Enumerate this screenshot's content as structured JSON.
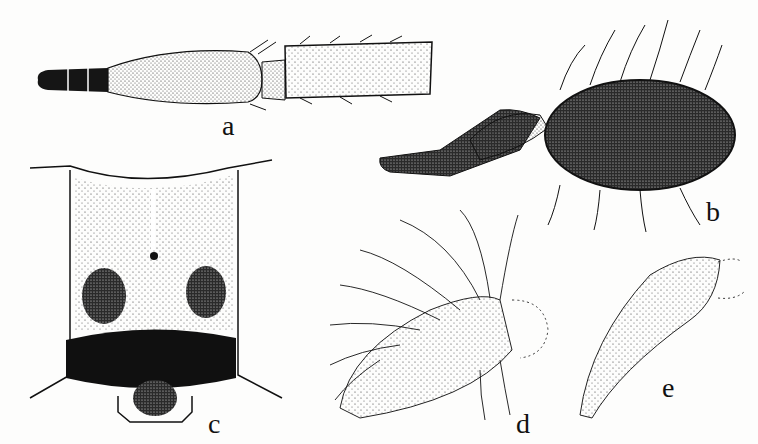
{
  "plate": {
    "description": "Scientific illustration plate of insect morphology (stippled ink drawings)",
    "background_color": "#fdfdfc",
    "ink_color": "#111111",
    "panels": [
      {
        "id": "a",
        "label": "a",
        "subject": "elongate antenna with dark segmented tip, stippled swollen segment and bristly distal segment"
      },
      {
        "id": "b",
        "label": "b",
        "subject": "antenna with dark oval hairy club bearing long setae"
      },
      {
        "id": "c",
        "label": "c",
        "subject": "head capsule frontal view with median line, central dot, two dark lateral spots and dark transverse band"
      },
      {
        "id": "d",
        "label": "d",
        "subject": "densely setose appendage with stippled basal lobe"
      },
      {
        "id": "e",
        "label": "e",
        "subject": "tapering stippled setose appendage with dotted outline tip"
      }
    ]
  }
}
